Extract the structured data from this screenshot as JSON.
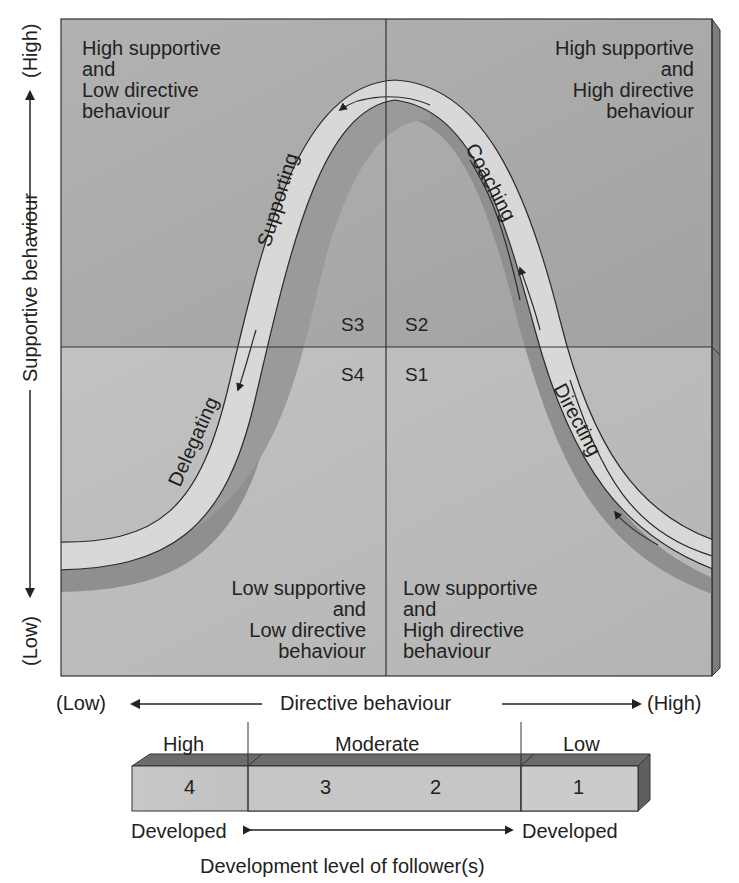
{
  "diagram": {
    "y_axis": {
      "label": "Supportive behaviour",
      "high": "(High)",
      "low": "(Low)"
    },
    "x_axis": {
      "label": "Directive behaviour",
      "low": "(Low)",
      "high": "(High)"
    },
    "quadrants": {
      "top_left": [
        "High supportive",
        "and",
        "Low directive",
        "behaviour"
      ],
      "top_right": [
        "High supportive",
        "and",
        "High directive",
        "behaviour"
      ],
      "bottom_left": [
        "Low supportive",
        "and",
        "Low directive",
        "behaviour"
      ],
      "bottom_right": [
        "Low supportive",
        "and",
        "High directive",
        "behaviour"
      ]
    },
    "styles": {
      "s1": "S1",
      "s2": "S2",
      "s3": "S3",
      "s4": "S4"
    },
    "curve_labels": {
      "directing": "Directing",
      "coaching": "Coaching",
      "supporting": "Supporting",
      "delegating": "Delegating"
    },
    "development_bar": {
      "groups": [
        {
          "label": "High",
          "cells": [
            "4"
          ]
        },
        {
          "label": "Moderate",
          "cells": [
            "3",
            "2"
          ]
        },
        {
          "label": "Low",
          "cells": [
            "1"
          ]
        }
      ],
      "left_caption": "Developed",
      "right_caption": "Developed",
      "title": "Development level of follower(s)"
    },
    "colors": {
      "upper_panel": "#a9a9a9",
      "lower_panel": "#bcbcbc",
      "curve_band": "#d9d9d9",
      "curve_shadow": "#8e8e8e",
      "line": "#2a2a2a"
    }
  }
}
